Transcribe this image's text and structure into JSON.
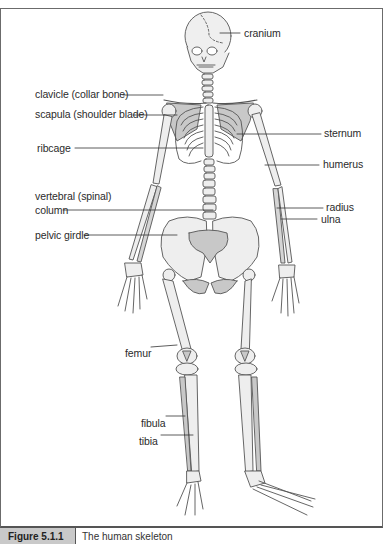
{
  "figure": {
    "caption": {
      "number": "Figure 5.1.1",
      "text": "The human skeleton"
    },
    "colors": {
      "bone_fill": "#eeeeee",
      "shaded_fill": "#c8c8c8",
      "outline": "#555555",
      "label": "#2b2b2b",
      "caption_bg": "#c9c9c9"
    },
    "labels": {
      "cranium": "cranium",
      "clavicle": "clavicle (collar bone)",
      "scapula": "scapula (shoulder blade)",
      "ribcage": "ribcage",
      "sternum": "sternum",
      "humerus": "humerus",
      "vertebral_1": "vertebral (spinal)",
      "vertebral_2": "column",
      "radius": "radius",
      "ulna": "ulna",
      "pelvic": "pelvic girdle",
      "femur": "femur",
      "fibula": "fibula",
      "tibia": "tibia"
    }
  }
}
